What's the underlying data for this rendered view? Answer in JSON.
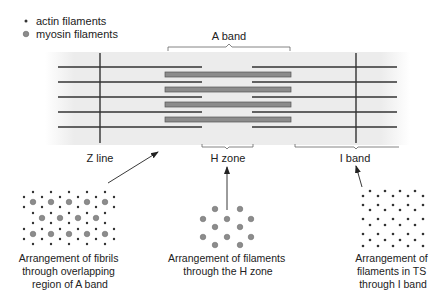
{
  "legend": {
    "items": [
      {
        "marker": "small-dot",
        "label": "actin filaments"
      },
      {
        "marker": "gray-circle",
        "label": "myosin filaments"
      }
    ]
  },
  "sarcomere": {
    "labels": {
      "a_band": "A band",
      "z_line": "Z line",
      "h_zone": "H zone",
      "i_band": "I band"
    }
  },
  "cross_sections": [
    {
      "id": "overlap",
      "caption_lines": [
        "Arrangement of fibrils",
        "through overlapping",
        "region of A band"
      ]
    },
    {
      "id": "h-zone",
      "caption_lines": [
        "Arrangement of filaments",
        "through the H zone"
      ]
    },
    {
      "id": "i-band",
      "caption_lines": [
        "Arrangement of",
        "filaments in TS",
        "through I band"
      ]
    }
  ],
  "colors": {
    "actin": "#333333",
    "myosin_fill": "#8c8c8c",
    "myosin_stroke": "#555555",
    "band_bg": "#ececec",
    "text": "#222222"
  }
}
